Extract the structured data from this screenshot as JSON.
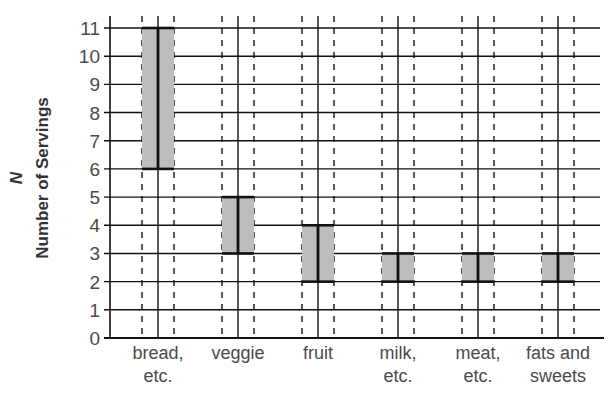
{
  "chart_data": {
    "type": "bar",
    "subtype": "floating-range",
    "title": "",
    "xlabel": "",
    "ylabel_symbol": "N",
    "ylabel": "Number of Servings",
    "ylim": [
      0,
      11
    ],
    "yticks": [
      0,
      1,
      2,
      3,
      4,
      5,
      6,
      7,
      8,
      9,
      10,
      11
    ],
    "grid": true,
    "categories": [
      {
        "lines": [
          "bread,",
          "etc."
        ]
      },
      {
        "lines": [
          "veggie"
        ]
      },
      {
        "lines": [
          "fruit"
        ]
      },
      {
        "lines": [
          "milk,",
          "etc."
        ]
      },
      {
        "lines": [
          "meat,",
          "etc."
        ]
      },
      {
        "lines": [
          "fats and",
          "sweets"
        ]
      }
    ],
    "category_names": [
      "bread, etc.",
      "veggie",
      "fruit",
      "milk, etc.",
      "meat, etc.",
      "fats and sweets"
    ],
    "ranges": [
      {
        "low": 6,
        "high": 11
      },
      {
        "low": 3,
        "high": 5
      },
      {
        "low": 2,
        "high": 4
      },
      {
        "low": 2,
        "high": 3
      },
      {
        "low": 2,
        "high": 3
      },
      {
        "low": 2,
        "high": 3
      }
    ],
    "colors": {
      "bar_fill": "#bdbdbd",
      "line": "#111111",
      "text": "#4a4a4a"
    }
  }
}
